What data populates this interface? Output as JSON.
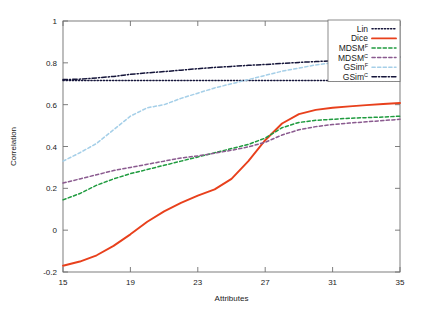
{
  "chart_data": {
    "type": "line",
    "title": "",
    "xlabel": "Attributes",
    "ylabel": "Correlation",
    "xlim": [
      15,
      35
    ],
    "ylim": [
      -0.2,
      1
    ],
    "xticks": [
      15,
      19,
      23,
      27,
      31,
      35
    ],
    "yticks": [
      -0.2,
      0,
      0.2,
      0.4,
      0.6,
      0.8,
      1
    ],
    "xtick_labels": [
      "15",
      "19",
      "23",
      "27",
      "31",
      "35"
    ],
    "ytick_labels": [
      "-0.2",
      "0",
      "0.2",
      "0.4",
      "0.6",
      "0.8",
      "1"
    ],
    "grid": false,
    "legend_position": "top-right",
    "x": [
      15,
      16,
      17,
      18,
      19,
      20,
      21,
      22,
      23,
      24,
      25,
      26,
      27,
      28,
      29,
      30,
      31,
      32,
      33,
      34,
      35
    ],
    "series": [
      {
        "name": "Lin",
        "label": "Lin",
        "sup": "",
        "color": "#15153a",
        "style": "dotted",
        "values": [
          0.715,
          0.715,
          0.715,
          0.715,
          0.715,
          0.715,
          0.715,
          0.715,
          0.715,
          0.715,
          0.715,
          0.715,
          0.715,
          0.715,
          0.715,
          0.715,
          0.715,
          0.715,
          0.715,
          0.715,
          0.715
        ]
      },
      {
        "name": "Dice",
        "label": "Dice",
        "sup": "",
        "color": "#e8401c",
        "style": "solid",
        "values": [
          -0.17,
          -0.15,
          -0.12,
          -0.075,
          -0.02,
          0.04,
          0.09,
          0.13,
          0.165,
          0.195,
          0.245,
          0.33,
          0.43,
          0.51,
          0.555,
          0.575,
          0.585,
          0.592,
          0.598,
          0.603,
          0.608
        ]
      },
      {
        "name": "MDSM-F",
        "label": "MDSM",
        "sup": "F",
        "color": "#1f9b3f",
        "style": "dashed",
        "values": [
          0.145,
          0.175,
          0.215,
          0.245,
          0.27,
          0.29,
          0.31,
          0.33,
          0.35,
          0.37,
          0.39,
          0.41,
          0.44,
          0.49,
          0.515,
          0.525,
          0.53,
          0.535,
          0.538,
          0.541,
          0.545
        ]
      },
      {
        "name": "MDSM-C",
        "label": "MDSM",
        "sup": "C",
        "color": "#8a5a8f",
        "style": "dashed",
        "values": [
          0.225,
          0.245,
          0.265,
          0.285,
          0.3,
          0.315,
          0.33,
          0.345,
          0.355,
          0.368,
          0.382,
          0.398,
          0.42,
          0.455,
          0.48,
          0.495,
          0.505,
          0.512,
          0.518,
          0.524,
          0.53
        ]
      },
      {
        "name": "GSim-F",
        "label": "GSim",
        "sup": "F",
        "color": "#a5cfe8",
        "style": "dashed",
        "values": [
          0.33,
          0.37,
          0.415,
          0.48,
          0.545,
          0.585,
          0.6,
          0.63,
          0.655,
          0.68,
          0.7,
          0.72,
          0.74,
          0.76,
          0.775,
          0.79,
          0.8,
          0.805,
          0.808,
          0.81,
          0.812
        ]
      },
      {
        "name": "GSim-C",
        "label": "GSim",
        "sup": "C",
        "color": "#15153a",
        "style": "dashdot",
        "values": [
          0.72,
          0.722,
          0.728,
          0.735,
          0.745,
          0.752,
          0.758,
          0.765,
          0.772,
          0.778,
          0.783,
          0.788,
          0.792,
          0.797,
          0.802,
          0.806,
          0.81,
          0.815,
          0.82,
          0.824,
          0.828
        ]
      }
    ]
  }
}
